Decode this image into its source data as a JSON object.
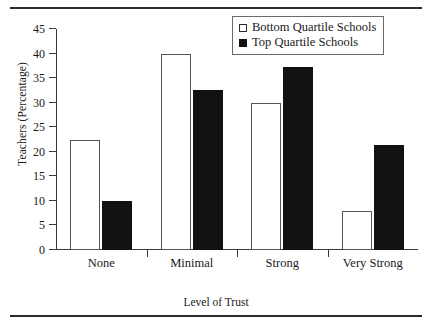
{
  "chart_data": {
    "type": "bar",
    "title": "",
    "xlabel": "Level of Trust",
    "ylabel": "Teachers (Percentage)",
    "categories": [
      "None",
      "Minimal",
      "Strong",
      "Very Strong"
    ],
    "series": [
      {
        "name": "Bottom Quartile Schools",
        "swatch": "open-square",
        "color": "#ffffff",
        "edge_color": "#555555",
        "values": [
          22.5,
          40,
          30,
          8
        ]
      },
      {
        "name": "Top Quartile Schools",
        "swatch": "filled-square",
        "color": "#111111",
        "edge_color": "#111111",
        "values": [
          10,
          32.5,
          37.3,
          21.3
        ]
      }
    ],
    "ylim": [
      0,
      45
    ],
    "yticks": [
      0,
      5,
      10,
      15,
      20,
      25,
      30,
      35,
      40,
      45
    ],
    "ytick_labels": [
      "0",
      "5",
      "10",
      "15",
      "20",
      "25",
      "30",
      "35",
      "40",
      "45"
    ],
    "grid": false,
    "legend_position": "top-right"
  },
  "figure": {
    "top_rule": "",
    "bottom_rule": ""
  }
}
